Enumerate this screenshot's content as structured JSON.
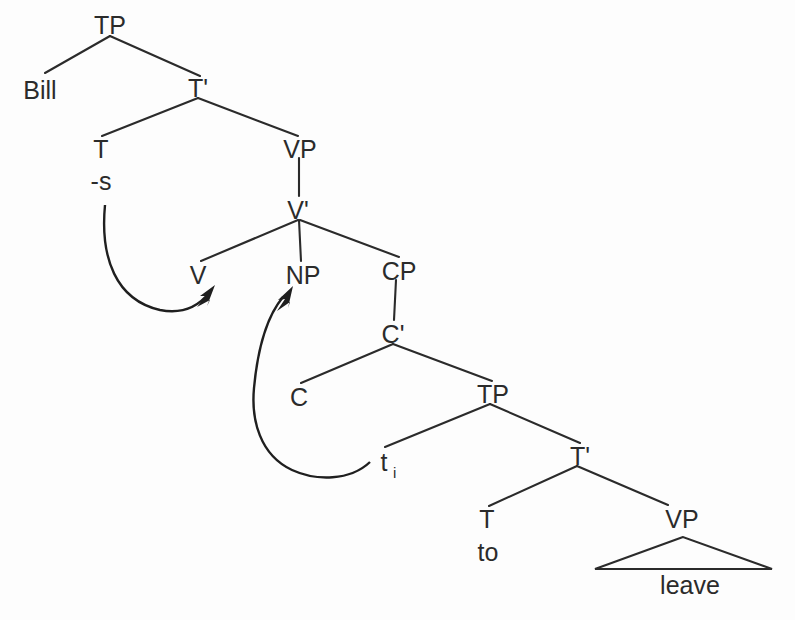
{
  "figure": {
    "kind": "syntax-tree",
    "title": "",
    "background_color": "#fdfdfd",
    "ink_color": "#2b2b2b"
  },
  "nodes": {
    "tp_root": "TP",
    "bill": "Bill",
    "t_bar_1": "T'",
    "t_1": "T",
    "suffix_s": "-s",
    "vp_1": "VP",
    "v_bar": "V'",
    "v_1": "V",
    "np": "NP",
    "cp": "CP",
    "c_bar": "C'",
    "c_head": "C",
    "tp_2": "TP",
    "trace_t": "t",
    "trace_index": "i",
    "t_bar_2": "T'",
    "t_2": "T",
    "to": "to",
    "vp_2": "VP",
    "leave": "leave"
  },
  "movement_arrows": [
    {
      "name": "affix-hopping-arrow",
      "from": "-s",
      "to": "V",
      "description": "T affix -s lowers onto V"
    },
    {
      "name": "trace-movement-arrow",
      "from": "t",
      "to": "NP",
      "description": "CP subject raises to NP object position"
    }
  ],
  "sentence": "Bill -s V NP CP C t to leave"
}
